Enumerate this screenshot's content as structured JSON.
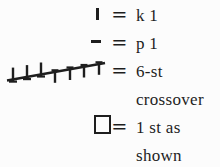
{
  "colors": {
    "ink": "#1e1e1e",
    "paper": "#fcfcfc"
  },
  "legend": {
    "entries": [
      {
        "icon": "k1-tick-icon",
        "equals": "=",
        "label": "k 1"
      },
      {
        "icon": "p1-dash-icon",
        "equals": "=",
        "label": "p 1"
      },
      {
        "icon": "six-stitch-crossover-icon",
        "equals": "=",
        "label": "6-st crossover"
      },
      {
        "icon": "open-square-icon",
        "equals": "=",
        "label": "1 st as shown"
      }
    ]
  }
}
